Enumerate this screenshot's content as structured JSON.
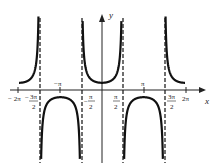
{
  "chart_data": {
    "type": "line",
    "title": "",
    "function": "y = sec(x)",
    "xlabel": "x",
    "ylabel": "y",
    "xlim": [
      -6.6,
      6.9
    ],
    "ylim": [
      -6,
      7
    ],
    "grid": false,
    "legend": null,
    "x_ticks": [
      {
        "value": -6.2832,
        "label": "−2π"
      },
      {
        "value": -4.7124,
        "label": "−3π/2"
      },
      {
        "value": -3.1416,
        "label": "−π"
      },
      {
        "value": -1.5708,
        "label": "−π/2"
      },
      {
        "value": 1.5708,
        "label": "π/2"
      },
      {
        "value": 3.1416,
        "label": "π"
      },
      {
        "value": 4.7124,
        "label": "3π/2"
      },
      {
        "value": 6.2832,
        "label": "2π"
      }
    ],
    "asymptotes": [
      -4.7124,
      -1.5708,
      1.5708,
      4.7124
    ],
    "series": [
      {
        "name": "sec(x)",
        "x_range": [
          -6.2832,
          -4.7124
        ],
        "sample_points": [
          [
            -6.2832,
            1
          ],
          [
            -5.5,
            1.41
          ],
          [
            -5.0,
            3.53
          ]
        ]
      },
      {
        "name": "sec(x)",
        "x_range": [
          -4.7124,
          -1.5708
        ],
        "sample_points": [
          [
            -4.2,
            -2.04
          ],
          [
            -3.1416,
            -1
          ],
          [
            -2.1,
            -1.98
          ]
        ]
      },
      {
        "name": "sec(x)",
        "x_range": [
          -1.5708,
          1.5708
        ],
        "sample_points": [
          [
            -1.2,
            2.76
          ],
          [
            0,
            1
          ],
          [
            1.2,
            2.76
          ]
        ]
      },
      {
        "name": "sec(x)",
        "x_range": [
          1.5708,
          4.7124
        ],
        "sample_points": [
          [
            2.1,
            -1.98
          ],
          [
            3.1416,
            -1
          ],
          [
            4.2,
            -2.04
          ]
        ]
      },
      {
        "name": "sec(x)",
        "x_range": [
          4.7124,
          6.2832
        ],
        "sample_points": [
          [
            5.0,
            3.53
          ],
          [
            5.5,
            1.41
          ],
          [
            6.2832,
            1
          ]
        ]
      }
    ]
  },
  "labels": {
    "x_axis": "x",
    "y_axis": "y",
    "tick_neg_2pi": "− 2π",
    "tick_neg_3pi2_num": "3π",
    "tick_neg_3pi2_den": "2",
    "tick_neg_pi": "−π",
    "tick_neg_pi2_num": "π",
    "tick_neg_pi2_den": "2",
    "tick_pi2_num": "π",
    "tick_pi2_den": "2",
    "tick_pi": "π",
    "tick_3pi2_num": "3π",
    "tick_3pi2_den": "2",
    "tick_2pi": "2π"
  }
}
